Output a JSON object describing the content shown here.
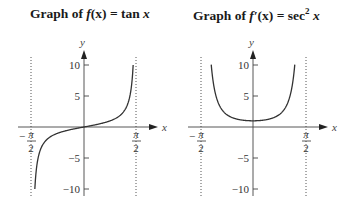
{
  "chart_data": [
    {
      "type": "line",
      "title": "Graph of f(x) = tan x",
      "xlabel": "x",
      "ylabel": "y",
      "xlim": [
        -1.5708,
        1.5708
      ],
      "ylim": [
        -10,
        10
      ],
      "x_ticks": [
        "-π/2",
        "π/2"
      ],
      "y_ticks": [
        -10,
        -5,
        5,
        10
      ],
      "asymptotes_x": [
        -1.5708,
        1.5708
      ],
      "grid": false,
      "series": [
        {
          "name": "tan x",
          "x": [
            -1.471,
            -1.4,
            -1.2,
            -1.0,
            -0.8,
            -0.5,
            0,
            0.5,
            0.8,
            1.0,
            1.2,
            1.4,
            1.471
          ],
          "values": [
            -10,
            -5.8,
            -2.57,
            -1.56,
            -1.03,
            -0.55,
            0,
            0.55,
            1.03,
            1.56,
            2.57,
            5.8,
            10
          ]
        }
      ]
    },
    {
      "type": "line",
      "title": "Graph of f′(x) = sec² x",
      "xlabel": "x",
      "ylabel": "y",
      "xlim": [
        -1.5708,
        1.5708
      ],
      "ylim": [
        -10,
        10
      ],
      "x_ticks": [
        "-π/2",
        "π/2"
      ],
      "y_ticks": [
        -10,
        -5,
        5,
        10
      ],
      "asymptotes_x": [
        -1.5708,
        1.5708
      ],
      "grid": false,
      "series": [
        {
          "name": "sec² x",
          "x": [
            -1.25,
            -1.2,
            -1.0,
            -0.8,
            -0.5,
            0,
            0.5,
            0.8,
            1.0,
            1.2,
            1.25
          ],
          "values": [
            10,
            7.6,
            3.43,
            2.06,
            1.3,
            1,
            1.3,
            2.06,
            3.43,
            7.6,
            10
          ]
        }
      ]
    }
  ],
  "titles": {
    "left": {
      "prefix": "Graph of ",
      "func": "f",
      "arg": "(x)",
      "eq": " = tan ",
      "var": "x"
    },
    "right": {
      "prefix": "Graph of ",
      "func": "f′",
      "arg": "(x)",
      "eq": " = sec",
      "sup": "2",
      "var": " x"
    }
  },
  "labels": {
    "y": "y",
    "x": "x",
    "ticks": {
      "p10": "10",
      "p5": "5",
      "m5": "−5",
      "m10": "−10",
      "pi": "π",
      "two": "2",
      "minus": "−"
    }
  }
}
